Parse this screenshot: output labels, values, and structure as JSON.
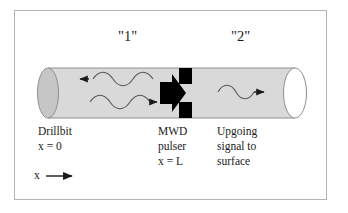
{
  "figure": {
    "type": "technical-diagram",
    "border_color": "#b4b4b4",
    "background": "#ffffff"
  },
  "zones": [
    {
      "name": "zone-one",
      "label": "\"1\"",
      "x": 120,
      "y": 30
    },
    {
      "name": "zone-two",
      "label": "\"2\"",
      "x": 232,
      "y": 30
    }
  ],
  "cylinder": {
    "body_fill": "#d9d9d9",
    "body_stroke": "#8c8c8c",
    "left_cap_fill": "#c6c6c6",
    "right_cap_fill": "#ffffff",
    "left": 48,
    "right": 295,
    "top": 68,
    "bottom": 118
  },
  "pulser": {
    "name": "mwd-pulser",
    "fill": "#000000",
    "arrow_label": "block-arrow-right",
    "squares": 2
  },
  "waves": [
    {
      "name": "wave-downgoing-reflected",
      "direction": "left",
      "zone": "1"
    },
    {
      "name": "wave-downgoing",
      "direction": "right",
      "zone": "1"
    },
    {
      "name": "wave-upgoing",
      "direction": "right",
      "zone": "2"
    }
  ],
  "captions": {
    "drillbit": {
      "lines": [
        "Drillbit",
        "x = 0"
      ],
      "x": 38,
      "y": 126
    },
    "pulser": {
      "lines": [
        "MWD",
        "pulser",
        "x = L"
      ],
      "x": 158,
      "y": 126
    },
    "upgoing": {
      "lines": [
        "Upgoing",
        "signal to",
        "surface"
      ],
      "x": 218,
      "y": 126
    }
  },
  "axis": {
    "name": "x-axis-indicator",
    "label": "x",
    "arrow": "right-arrow",
    "x": 34,
    "y": 172
  }
}
